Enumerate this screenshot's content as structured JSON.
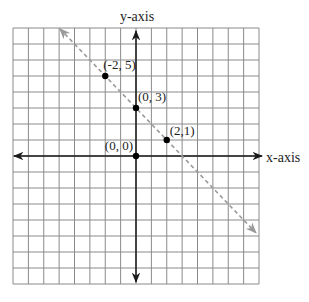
{
  "figure": {
    "x_axis_label": "x-axis",
    "y_axis_label": "y-axis"
  },
  "chart_data": {
    "type": "line",
    "title": "",
    "xlabel": "x-axis",
    "ylabel": "y-axis",
    "xlim": [
      -8,
      8
    ],
    "ylim": [
      -8,
      8
    ],
    "grid": true,
    "grid_step": 1,
    "tick_labels_shown": false,
    "line": {
      "equation": "y = -x + 3",
      "slope": -1,
      "intercept": 3,
      "style": "dashed",
      "color": "#9a9a9a",
      "arrows_both_ends": true
    },
    "points": [
      {
        "x": -2,
        "y": 5,
        "label": "(-2, 5)"
      },
      {
        "x": 0,
        "y": 3,
        "label": "(0, 3)"
      },
      {
        "x": 2,
        "y": 1,
        "label": "(2,1)"
      },
      {
        "x": 0,
        "y": 0,
        "label": "(0, 0)"
      }
    ]
  },
  "colors": {
    "grid": "#8a8a8a",
    "axes": "#1a1a1a",
    "points": "#000000",
    "dashed_line": "#9a9a9a"
  }
}
